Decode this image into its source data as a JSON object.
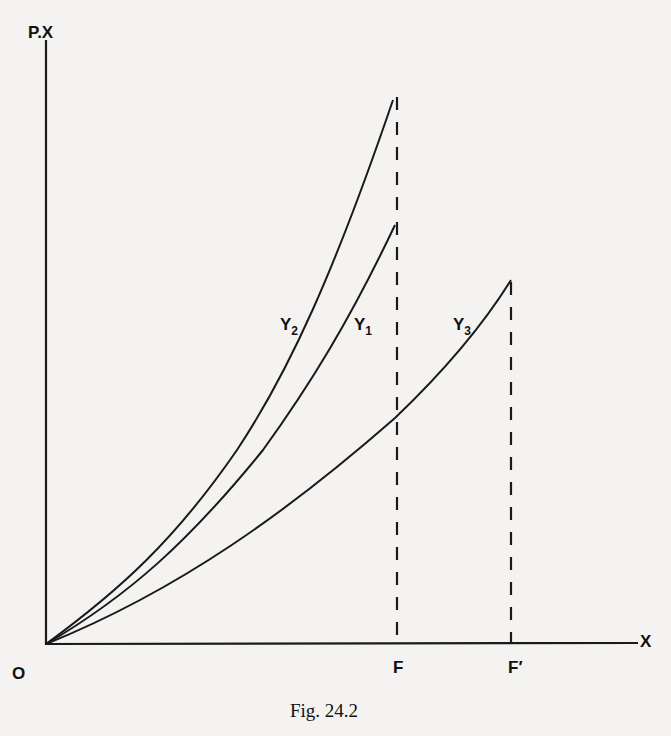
{
  "figure": {
    "caption": "Fig. 24.2",
    "y_axis_label": "P.X",
    "x_axis_label": "X",
    "origin_label": "O",
    "x_markers": [
      {
        "id": "F",
        "label": "F",
        "x": 398
      },
      {
        "id": "F_prime",
        "label": "F′",
        "x": 512
      }
    ],
    "curves": [
      {
        "id": "Y2",
        "base": "Y",
        "subscript": "2"
      },
      {
        "id": "Y1",
        "base": "Y",
        "subscript": "1"
      },
      {
        "id": "Y3",
        "base": "Y",
        "subscript": "3"
      }
    ],
    "colors": {
      "ink": "#1a1a1a",
      "paper": "#f4f3f1"
    }
  }
}
